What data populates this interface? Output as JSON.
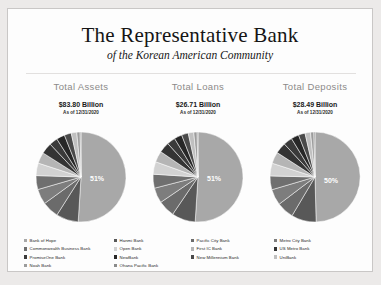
{
  "slide": {
    "title_main": "The Representative Bank",
    "title_sub": "of the Korean American Community",
    "background_color": "#fdfdfd",
    "page_color": "#eceae9"
  },
  "columns": [
    {
      "heading": "Total Assets",
      "value": "$83.80 Billion",
      "as_of": "As of 12/31/2020",
      "major_label": "51%"
    },
    {
      "heading": "Total Loans",
      "value": "$26.71 Billion",
      "as_of": "As of 12/31/2020",
      "major_label": "51%"
    },
    {
      "heading": "Total Deposits",
      "value": "$28.49 Billion",
      "as_of": "As of 12/31/2020",
      "major_label": "50%"
    }
  ],
  "legend_columns": [
    {
      "items": [
        {
          "label": "Bank of Hope",
          "color": "#a8a8a8"
        },
        {
          "label": "Commonwealth Business Bank",
          "color": "#6f6f6f"
        },
        {
          "label": "PromiseOne Bank",
          "color": "#3a3a3a"
        },
        {
          "label": "Noah Bank",
          "color": "#9c9c9c"
        }
      ]
    },
    {
      "items": [
        {
          "label": "Hanmi Bank",
          "color": "#585858"
        },
        {
          "label": "Open Bank",
          "color": "#d2d2d2"
        },
        {
          "label": "NewBank",
          "color": "#272727"
        },
        {
          "label": "Ohana Pacific Bank",
          "color": "#8b8b8b"
        }
      ]
    },
    {
      "items": [
        {
          "label": "Pacific City Bank",
          "color": "#6b6b6b"
        },
        {
          "label": "First IC Bank",
          "color": "#b5b5b5"
        },
        {
          "label": "New Millennium Bank",
          "color": "#4a4a4a"
        }
      ]
    },
    {
      "items": [
        {
          "label": "Metro City Bank",
          "color": "#7d7d7d"
        },
        {
          "label": "US Metro Bank",
          "color": "#343434"
        },
        {
          "label": "UniBank",
          "color": "#c0c0c0"
        }
      ]
    }
  ],
  "chart_data": [
    {
      "type": "pie",
      "title": "Total Assets",
      "total": "$83.80 Billion",
      "labels": [
        "Bank of Hope",
        "Hanmi Bank",
        "Pacific City Bank",
        "Metro City Bank",
        "Commonwealth Business Bank",
        "Open Bank",
        "First IC Bank",
        "US Metro Bank",
        "PromiseOne Bank",
        "NewBank",
        "New Millennium Bank",
        "UniBank",
        "Noah Bank",
        "Ohana Pacific Bank"
      ],
      "values": [
        51,
        8,
        6,
        5.5,
        5,
        4.5,
        4,
        4,
        3,
        3,
        2.5,
        2,
        1.2,
        0.3
      ],
      "displayed_labels": [
        "51%"
      ],
      "legend_position": "bottom"
    },
    {
      "type": "pie",
      "title": "Total Loans",
      "total": "$26.71 Billion",
      "labels": [
        "Bank of Hope",
        "Hanmi Bank",
        "Pacific City Bank",
        "Metro City Bank",
        "Commonwealth Business Bank",
        "Open Bank",
        "First IC Bank",
        "US Metro Bank",
        "PromiseOne Bank",
        "NewBank",
        "New Millennium Bank",
        "UniBank",
        "Noah Bank",
        "Ohana Pacific Bank"
      ],
      "values": [
        51,
        8.5,
        6,
        5.5,
        5,
        4.5,
        4,
        3.8,
        3,
        2.8,
        2.4,
        2,
        1.2,
        0.3
      ],
      "displayed_labels": [
        "51%"
      ],
      "legend_position": "bottom"
    },
    {
      "type": "pie",
      "title": "Total Deposits",
      "total": "$28.49 Billion",
      "labels": [
        "Bank of Hope",
        "Hanmi Bank",
        "Pacific City Bank",
        "Metro City Bank",
        "Commonwealth Business Bank",
        "Open Bank",
        "First IC Bank",
        "US Metro Bank",
        "PromiseOne Bank",
        "NewBank",
        "New Millennium Bank",
        "UniBank",
        "Noah Bank",
        "Ohana Pacific Bank"
      ],
      "values": [
        50,
        9,
        6.2,
        5.8,
        5,
        4.6,
        4.2,
        4,
        3.2,
        2.8,
        2.4,
        2,
        1.2,
        0.4
      ],
      "displayed_labels": [
        "50%"
      ],
      "legend_position": "bottom"
    }
  ]
}
